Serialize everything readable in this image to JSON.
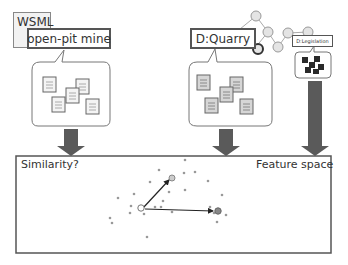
{
  "labels": {
    "wsml": "WSML",
    "open_pit": "open-pit mine",
    "quarry": "D:Quarry",
    "legislation": "D:Legislation",
    "similarity": "Similarity?",
    "feature_space": "Feature space"
  },
  "colors": {
    "arrow_fill": "#5a5a5a",
    "border": "#555555",
    "doc_fill_light": "#f4f4f4",
    "doc_fill_grey": "#d6d6d6",
    "node_fill": "#dddddd",
    "block_fill": "#2a2a2a",
    "point": "#888888"
  },
  "points": [
    {
      "x": 185,
      "y": 160
    },
    {
      "x": 159,
      "y": 170
    },
    {
      "x": 184,
      "y": 173
    },
    {
      "x": 195,
      "y": 172
    },
    {
      "x": 150,
      "y": 182
    },
    {
      "x": 206,
      "y": 181
    },
    {
      "x": 185,
      "y": 190
    },
    {
      "x": 134,
      "y": 194
    },
    {
      "x": 222,
      "y": 195
    },
    {
      "x": 169,
      "y": 192
    },
    {
      "x": 163,
      "y": 201
    },
    {
      "x": 118,
      "y": 198
    },
    {
      "x": 131,
      "y": 206
    },
    {
      "x": 155,
      "y": 207
    },
    {
      "x": 130,
      "y": 213
    },
    {
      "x": 145,
      "y": 212
    },
    {
      "x": 110,
      "y": 218
    },
    {
      "x": 144,
      "y": 214
    },
    {
      "x": 210,
      "y": 207
    },
    {
      "x": 226,
      "y": 215
    },
    {
      "x": 214,
      "y": 213
    },
    {
      "x": 217,
      "y": 222
    },
    {
      "x": 147,
      "y": 237
    },
    {
      "x": 112,
      "y": 223
    }
  ]
}
